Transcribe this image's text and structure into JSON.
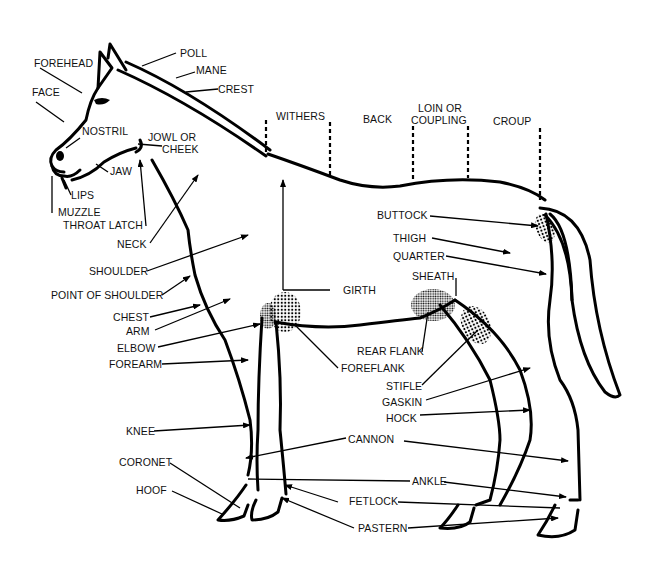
{
  "diagram": {
    "labels": {
      "forehead": "FOREHEAD",
      "poll": "POLL",
      "mane": "MANE",
      "crest": "CREST",
      "face": "FACE",
      "nostril": "NOSTRIL",
      "jowl_1": "JOWL OR",
      "jowl_2": "CHEEK",
      "jaw": "JAW",
      "lips": "LIPS",
      "muzzle": "MUZZLE",
      "throat_latch": "THROAT LATCH",
      "neck": "NECK",
      "shoulder": "SHOULDER",
      "point_of_shoulder": "POINT OF SHOULDER",
      "chest": "CHEST",
      "arm": "ARM",
      "elbow": "ELBOW",
      "forearm": "FOREARM",
      "withers": "WITHERS",
      "back": "BACK",
      "loin_1": "LOIN OR",
      "loin_2": "COUPLING",
      "croup": "CROUP",
      "buttock": "BUTTOCK",
      "thigh": "THIGH",
      "quarter": "QUARTER",
      "sheath": "SHEATH",
      "girth": "GIRTH",
      "rear_flank": "REAR FLANK",
      "foreflank": "FOREFLANK",
      "stifle": "STIFLE",
      "gaskin": "GASKIN",
      "hock": "HOCK",
      "knee": "KNEE",
      "cannon": "CANNON",
      "coronet": "CORONET",
      "ankle": "ANKLE",
      "hoof": "HOOF",
      "fetlock": "FETLOCK",
      "pastern": "PASTERN"
    }
  }
}
